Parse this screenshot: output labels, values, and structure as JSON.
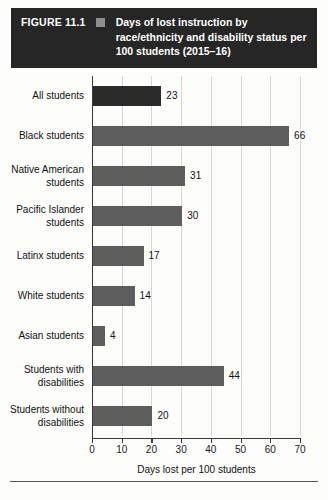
{
  "figure": {
    "number_label": "FIGURE 11.1",
    "marker_icon": "legend-square-icon",
    "title": "Days of lost instruction by race/ethnicity and disability status per 100 students (2015–16)",
    "header_bg": "#262626",
    "marker_color": "#8e8e8e"
  },
  "chart_data": {
    "type": "bar",
    "orientation": "horizontal",
    "title": "Days of lost instruction by race/ethnicity and disability status per 100 students (2015–16)",
    "xlabel": "Days lost per 100 students",
    "ylabel": "",
    "xlim": [
      0,
      70
    ],
    "xticks": [
      0,
      10,
      20,
      30,
      40,
      50,
      60,
      70
    ],
    "xtick_labels": [
      "0",
      "10",
      "20",
      "30",
      "40",
      "50",
      "60",
      "70"
    ],
    "grid": true,
    "grid_axis": "x",
    "legend": false,
    "bar_color": "#5d5d5d",
    "categories": [
      "All students",
      "Black students",
      "Native American students",
      "Pacific Islander students",
      "Latinx students",
      "White students",
      "Asian students",
      "Students with disabilities",
      "Students without disabilities"
    ],
    "values": [
      23,
      66,
      31,
      30,
      17,
      14,
      4,
      44,
      20
    ],
    "value_labels": [
      "23",
      "66",
      "31",
      "30",
      "17",
      "14",
      "4",
      "44",
      "20"
    ],
    "bars": [
      {
        "category": "All students",
        "label_lines": [
          "All students"
        ],
        "value": 23,
        "value_label": "23",
        "shade": "dark"
      },
      {
        "category": "Black students",
        "label_lines": [
          "Black students"
        ],
        "value": 66,
        "value_label": "66",
        "shade": "normal"
      },
      {
        "category": "Native American students",
        "label_lines": [
          "Native American",
          "students"
        ],
        "value": 31,
        "value_label": "31",
        "shade": "normal"
      },
      {
        "category": "Pacific Islander students",
        "label_lines": [
          "Pacific Islander",
          "students"
        ],
        "value": 30,
        "value_label": "30",
        "shade": "normal"
      },
      {
        "category": "Latinx students",
        "label_lines": [
          "Latinx students"
        ],
        "value": 17,
        "value_label": "17",
        "shade": "normal"
      },
      {
        "category": "White students",
        "label_lines": [
          "White students"
        ],
        "value": 14,
        "value_label": "14",
        "shade": "normal"
      },
      {
        "category": "Asian students",
        "label_lines": [
          "Asian students"
        ],
        "value": 4,
        "value_label": "4",
        "shade": "normal"
      },
      {
        "category": "Students with disabilities",
        "label_lines": [
          "Students with",
          "disabilities"
        ],
        "value": 44,
        "value_label": "44",
        "shade": "normal"
      },
      {
        "category": "Students without disabilities",
        "label_lines": [
          "Students without",
          "disabilities"
        ],
        "value": 20,
        "value_label": "20",
        "shade": "normal"
      }
    ]
  }
}
